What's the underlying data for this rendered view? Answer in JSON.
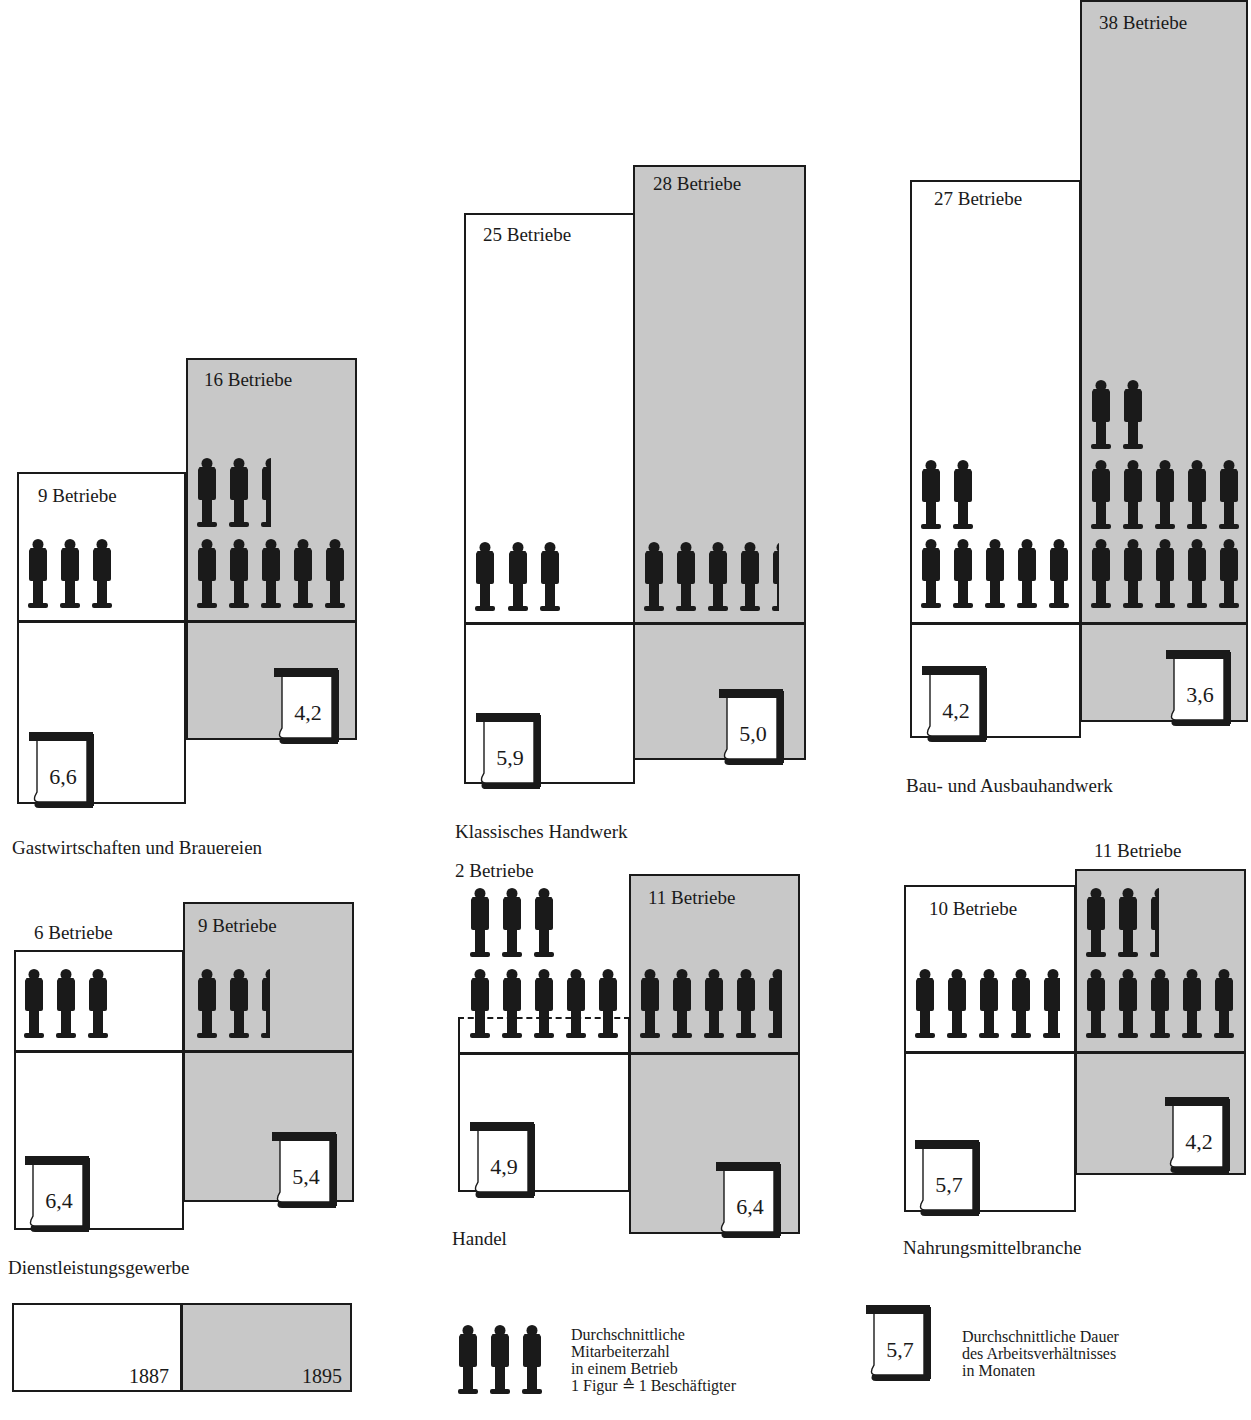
{
  "colors": {
    "year_1887": "#ffffff",
    "year_1895": "#c8c8c8",
    "ink": "#1a1a1a"
  },
  "chart_data": {
    "type": "pictogram-bar",
    "title": "",
    "categories": [
      "Gastwirtschaften und Brauereien",
      "Klassisches Handwerk",
      "Bau- und Ausbauhandwerk",
      "Dienstleistungsgewerbe",
      "Handel",
      "Nahrungsmittelbranche"
    ],
    "series": [
      {
        "name": "Betriebe 1887",
        "values": [
          9,
          25,
          27,
          6,
          2,
          10
        ]
      },
      {
        "name": "Betriebe 1895",
        "values": [
          16,
          28,
          38,
          9,
          11,
          11
        ]
      },
      {
        "name": "Mitarbeiter je Betrieb 1887",
        "values": [
          3,
          3,
          7,
          3,
          8,
          4.8
        ]
      },
      {
        "name": "Mitarbeiter je Betrieb 1895",
        "values": [
          7.5,
          4.3,
          12,
          2.5,
          4.7,
          7.5
        ]
      },
      {
        "name": "Dauer Arbeitsverhältnis (Monate) 1887",
        "values": [
          6.6,
          5.9,
          4.2,
          6.4,
          4.9,
          5.7
        ]
      },
      {
        "name": "Dauer Arbeitsverhältnis (Monate) 1895",
        "values": [
          4.2,
          5.0,
          3.6,
          5.4,
          6.4,
          4.2
        ]
      }
    ],
    "legend": [
      "1887",
      "1895"
    ]
  },
  "sectors": [
    {
      "name": "Gastwirtschaften und Brauereien",
      "title_pos": [
        12,
        838
      ],
      "sep_y": 620,
      "y1887": {
        "label": "9 Betriebe",
        "box": [
          17,
          472,
          169,
          332
        ],
        "label_pos": [
          38,
          486
        ],
        "figures": [
          [
            27,
            539,
            1
          ],
          [
            59,
            539,
            1
          ],
          [
            91,
            539,
            1
          ]
        ],
        "calendar": {
          "value": "6,6",
          "pos": [
            27,
            730
          ]
        }
      },
      "y1895": {
        "label": "16 Betriebe",
        "box": [
          186,
          358,
          171,
          382
        ],
        "label_pos": [
          204,
          370
        ],
        "figures": [
          [
            196,
            458,
            1
          ],
          [
            228,
            458,
            1
          ],
          [
            260,
            458,
            0.5
          ],
          [
            196,
            539,
            1
          ],
          [
            228,
            539,
            1
          ],
          [
            260,
            539,
            1
          ],
          [
            292,
            539,
            1
          ],
          [
            324,
            539,
            1
          ]
        ],
        "calendar": {
          "value": "4,2",
          "pos": [
            272,
            666
          ]
        }
      }
    },
    {
      "name": "Klassisches Handwerk",
      "title_pos": [
        455,
        822
      ],
      "sep_y": 622,
      "y1887": {
        "label": "25 Betriebe",
        "box": [
          464,
          213,
          171,
          571
        ],
        "label_pos": [
          483,
          225
        ],
        "figures": [
          [
            474,
            542,
            1
          ],
          [
            507,
            542,
            1
          ],
          [
            539,
            542,
            1
          ]
        ],
        "calendar": {
          "value": "5,9",
          "pos": [
            474,
            711
          ]
        }
      },
      "y1895": {
        "label": "28 Betriebe",
        "box": [
          633,
          165,
          173,
          595
        ],
        "label_pos": [
          653,
          174
        ],
        "figures": [
          [
            643,
            542,
            1
          ],
          [
            675,
            542,
            1
          ],
          [
            707,
            542,
            1
          ],
          [
            739,
            542,
            1
          ],
          [
            771,
            542,
            0.35
          ]
        ],
        "calendar": {
          "value": "5,0",
          "pos": [
            717,
            687
          ]
        }
      }
    },
    {
      "name": "Bau- und Ausbauhandwerk",
      "title_pos": [
        906,
        776
      ],
      "sep_y": 622,
      "y1887": {
        "label": "27 Betriebe",
        "box": [
          910,
          180,
          171,
          558
        ],
        "label_pos": [
          934,
          189
        ],
        "figures": [
          [
            920,
            460,
            1
          ],
          [
            952,
            460,
            1
          ],
          [
            920,
            539,
            1
          ],
          [
            952,
            539,
            1
          ],
          [
            984,
            539,
            1
          ],
          [
            1016,
            539,
            1
          ],
          [
            1048,
            539,
            1
          ]
        ],
        "calendar": {
          "value": "4,2",
          "pos": [
            920,
            664
          ]
        }
      },
      "y1895": {
        "label": "38 Betriebe",
        "box": [
          1080,
          0,
          168,
          722
        ],
        "label_pos": [
          1099,
          13
        ],
        "figures": [
          [
            1090,
            380,
            1
          ],
          [
            1122,
            380,
            1
          ],
          [
            1090,
            460,
            1
          ],
          [
            1122,
            460,
            1
          ],
          [
            1154,
            460,
            1
          ],
          [
            1186,
            460,
            1
          ],
          [
            1218,
            460,
            1
          ],
          [
            1090,
            539,
            1
          ],
          [
            1122,
            539,
            1
          ],
          [
            1154,
            539,
            1
          ],
          [
            1186,
            539,
            1
          ],
          [
            1218,
            539,
            1
          ]
        ],
        "calendar": {
          "value": "3,6",
          "pos": [
            1164,
            648
          ]
        }
      }
    },
    {
      "name": "Dienstleistungsgewerbe",
      "title_pos": [
        8,
        1258
      ],
      "sep_y": 1050,
      "y1887": {
        "label": "6 Betriebe",
        "box": [
          14,
          950,
          170,
          280
        ],
        "label_pos": [
          34,
          923
        ],
        "figures": [
          [
            23,
            969,
            1
          ],
          [
            55,
            969,
            1
          ],
          [
            87,
            969,
            1
          ]
        ],
        "calendar": {
          "value": "6,4",
          "pos": [
            23,
            1154
          ]
        }
      },
      "y1895": {
        "label": "9 Betriebe",
        "box": [
          183,
          902,
          171,
          300
        ],
        "label_pos": [
          198,
          916
        ],
        "figures": [
          [
            196,
            969,
            1
          ],
          [
            228,
            969,
            1
          ],
          [
            260,
            969,
            0.45
          ]
        ],
        "calendar": {
          "value": "5,4",
          "pos": [
            270,
            1130
          ]
        }
      }
    },
    {
      "name": "Handel",
      "title_pos": [
        452,
        1229
      ],
      "sep_y": 1052,
      "y1887": {
        "label": "2 Betriebe",
        "box": [
          458,
          1017,
          172,
          175
        ],
        "label_pos": [
          455,
          861
        ],
        "dashed_top": true,
        "figures": [
          [
            469,
            888,
            1
          ],
          [
            501,
            888,
            1
          ],
          [
            533,
            888,
            1
          ],
          [
            469,
            969,
            1
          ],
          [
            501,
            969,
            1
          ],
          [
            533,
            969,
            1
          ],
          [
            565,
            969,
            1
          ],
          [
            597,
            969,
            1
          ]
        ],
        "calendar": {
          "value": "4,9",
          "pos": [
            468,
            1120
          ]
        }
      },
      "y1895": {
        "label": "11 Betriebe",
        "box": [
          629,
          874,
          171,
          360
        ],
        "label_pos": [
          648,
          888
        ],
        "figures": [
          [
            639,
            969,
            1
          ],
          [
            671,
            969,
            1
          ],
          [
            703,
            969,
            1
          ],
          [
            735,
            969,
            1
          ],
          [
            767,
            969,
            0.7
          ]
        ],
        "calendar": {
          "value": "6,4",
          "pos": [
            714,
            1160
          ]
        }
      }
    },
    {
      "name": "Nahrungsmittelbranche",
      "title_pos": [
        903,
        1238
      ],
      "sep_y": 1051,
      "y1887": {
        "label": "10 Betriebe",
        "box": [
          904,
          885,
          172,
          327
        ],
        "label_pos": [
          929,
          899
        ],
        "figures": [
          [
            914,
            969,
            1
          ],
          [
            946,
            969,
            1
          ],
          [
            978,
            969,
            1
          ],
          [
            1010,
            969,
            1
          ],
          [
            1042,
            969,
            0.8
          ]
        ],
        "calendar": {
          "value": "5,7",
          "pos": [
            913,
            1138
          ]
        }
      },
      "y1895": {
        "label": "11 Betriebe",
        "box": [
          1075,
          869,
          171,
          306
        ],
        "label_pos": [
          1094,
          841
        ],
        "figures": [
          [
            1085,
            888,
            1
          ],
          [
            1117,
            888,
            1
          ],
          [
            1149,
            888,
            0.45
          ],
          [
            1085,
            969,
            1
          ],
          [
            1117,
            969,
            1
          ],
          [
            1149,
            969,
            1
          ],
          [
            1181,
            969,
            1
          ],
          [
            1213,
            969,
            1
          ]
        ],
        "calendar": {
          "value": "4,2",
          "pos": [
            1163,
            1095
          ]
        }
      }
    }
  ],
  "legend": {
    "years_box": {
      "box": [
        12,
        1303,
        340,
        89
      ],
      "split_x": 181,
      "year_1887": "1887",
      "year_1895": "1895"
    },
    "figures": {
      "icon_pos": [
        [
          457,
          1325
        ],
        [
          489,
          1325
        ],
        [
          521,
          1325
        ]
      ],
      "text": "Durchschnittliche\nMitarbeiterzahl\nin einem Betrieb\n1 Figur ≙ 1 Beschäftigter",
      "text_pos": [
        571,
        1326
      ]
    },
    "calendar": {
      "value": "5,7",
      "pos": [
        864,
        1303
      ],
      "text": "Durchschnittliche Dauer\ndes Arbeitsverhältnisses\nin Monaten",
      "text_pos": [
        962,
        1328
      ]
    }
  }
}
